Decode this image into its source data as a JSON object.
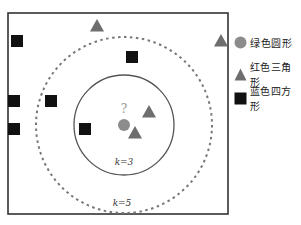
{
  "diagram": {
    "query_label": "?",
    "circles": [
      {
        "k_label": "k=3",
        "style": "solid"
      },
      {
        "k_label": "k=5",
        "style": "dashed"
      }
    ],
    "points": [
      {
        "class": "triangle",
        "x": 97,
        "y": 26
      },
      {
        "class": "triangle",
        "x": 221,
        "y": 41
      },
      {
        "class": "triangle",
        "x": 149,
        "y": 112
      },
      {
        "class": "triangle",
        "x": 135,
        "y": 133
      },
      {
        "class": "square",
        "x": 17,
        "y": 41
      },
      {
        "class": "square",
        "x": 132,
        "y": 57
      },
      {
        "class": "square",
        "x": 14,
        "y": 101
      },
      {
        "class": "square",
        "x": 51,
        "y": 101
      },
      {
        "class": "square",
        "x": 14,
        "y": 129
      },
      {
        "class": "square",
        "x": 85,
        "y": 129
      }
    ],
    "query_point": {
      "x": 124,
      "y": 125
    },
    "colors": {
      "circle": "#8c8c8c",
      "triangle": "#6e6e6e",
      "square": "#111111",
      "border": "#333333",
      "dashed": "#777777"
    }
  },
  "legend": {
    "items": [
      {
        "shape": "circle",
        "label": "绿色圆形"
      },
      {
        "shape": "triangle",
        "label": "红色三角形"
      },
      {
        "shape": "square",
        "label": "蓝色四方形"
      }
    ]
  }
}
